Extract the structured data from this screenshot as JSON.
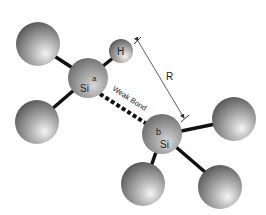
{
  "diagram": {
    "atoms": {
      "si_a": {
        "element": "Si",
        "tag": "a"
      },
      "si_b": {
        "element": "Si",
        "tag": "b"
      },
      "hydrogen": {
        "element": "H"
      }
    },
    "labels": {
      "weak_bond": "Weak Bond",
      "distance": "R"
    },
    "colors": {
      "sphere_light": "#f2f2f2",
      "sphere_mid": "#a0a0a0",
      "sphere_dark": "#555555",
      "bond": "#111111",
      "background": "#ffffff"
    }
  }
}
